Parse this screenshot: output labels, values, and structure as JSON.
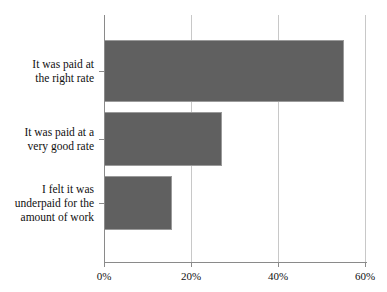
{
  "chart_data": {
    "type": "bar",
    "orientation": "horizontal",
    "title": "",
    "xlabel": "",
    "ylabel": "",
    "categories": [
      "It was paid at the right rate",
      "It was paid at a very good rate",
      "I felt it was underpaid for the amount of work"
    ],
    "category_lines": [
      [
        "It was paid at",
        "the right rate"
      ],
      [
        "It was paid at a",
        "very good rate"
      ],
      [
        "I felt it was",
        "underpaid for the",
        "amount of work"
      ]
    ],
    "values": [
      55,
      27,
      15.5
    ],
    "value_unit": "%",
    "xlim": [
      0,
      60
    ],
    "xticks": [
      0,
      20,
      40,
      60
    ],
    "xtick_labels": [
      "0%",
      "20%",
      "40%",
      "60%"
    ],
    "grid": "vertical",
    "legend": "none",
    "bar_color": "#606060",
    "bar_border_color": "#9a9a9a",
    "gridline_color": "#c8c8c8",
    "axis_color": "#8a8a8a",
    "background": "#ffffff"
  }
}
